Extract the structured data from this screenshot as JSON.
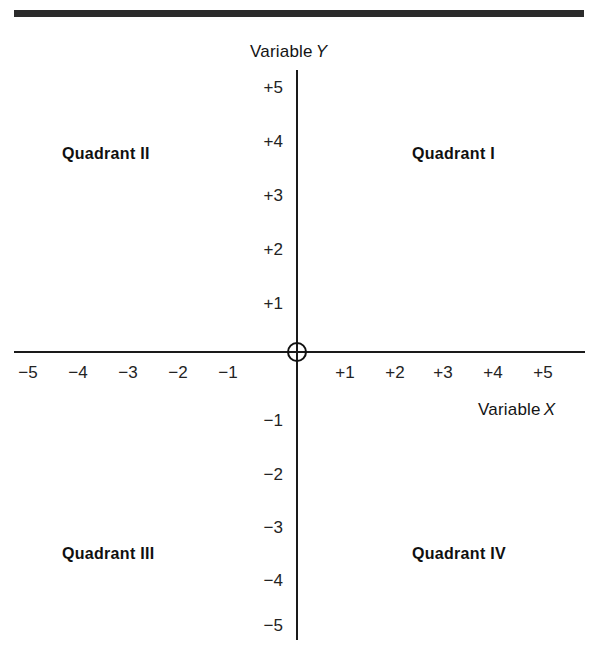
{
  "figure": {
    "top_rule_color": "#2b2b2b",
    "axis_color": "#1a1a1a",
    "background_color": "#ffffff"
  },
  "axis_names": {
    "y_prefix": "Variable",
    "y_letter": "Y",
    "x_prefix": "Variable",
    "x_letter": "X"
  },
  "origin": {
    "marker": "origin-circle",
    "value": "0"
  },
  "quadrants": [
    {
      "key": "q2",
      "label": "Quadrant II",
      "x": 62,
      "y": 145
    },
    {
      "key": "q1",
      "label": "Quadrant I",
      "x": 412,
      "y": 145
    },
    {
      "key": "q3",
      "label": "Quadrant III",
      "x": 62,
      "y": 545
    },
    {
      "key": "q4",
      "label": "Quadrant IV",
      "x": 412,
      "y": 545
    }
  ],
  "y_ticks": [
    {
      "label": "+5",
      "value": 5,
      "top": 78
    },
    {
      "label": "+4",
      "value": 4,
      "top": 132
    },
    {
      "label": "+3",
      "value": 3,
      "top": 186
    },
    {
      "label": "+2",
      "value": 2,
      "top": 240
    },
    {
      "label": "+1",
      "value": 1,
      "top": 294
    },
    {
      "label": "−1",
      "value": -1,
      "top": 411
    },
    {
      "label": "−2",
      "value": -2,
      "top": 465
    },
    {
      "label": "−3",
      "value": -3,
      "top": 518
    },
    {
      "label": "−4",
      "value": -4,
      "top": 571
    },
    {
      "label": "−5",
      "value": -5,
      "top": 616
    }
  ],
  "x_ticks": [
    {
      "label": "−5",
      "value": -5,
      "left": 6
    },
    {
      "label": "−4",
      "value": -4,
      "left": 56
    },
    {
      "label": "−3",
      "value": -3,
      "left": 106
    },
    {
      "label": "−2",
      "value": -2,
      "left": 156
    },
    {
      "label": "−1",
      "value": -1,
      "left": 206
    },
    {
      "label": "+1",
      "value": 1,
      "left": 323
    },
    {
      "label": "+2",
      "value": 2,
      "left": 373
    },
    {
      "label": "+3",
      "value": 3,
      "left": 421
    },
    {
      "label": "+4",
      "value": 4,
      "left": 471
    },
    {
      "label": "+5",
      "value": 5,
      "left": 521
    }
  ],
  "chart_data": {
    "type": "scatter",
    "title": "",
    "subtitle": "",
    "xlabel": "Variable X",
    "ylabel": "Variable Y",
    "xlim": [
      -5.7,
      5.7
    ],
    "ylim": [
      -5.6,
      5.4
    ],
    "xticks": [
      -5,
      -4,
      -3,
      -2,
      -1,
      1,
      2,
      3,
      4,
      5
    ],
    "xticklabels": [
      "−5",
      "−4",
      "−3",
      "−2",
      "−1",
      "+1",
      "+2",
      "+3",
      "+4",
      "+5"
    ],
    "yticks": [
      5,
      4,
      3,
      2,
      1,
      -1,
      -2,
      -3,
      -4,
      -5
    ],
    "yticklabels": [
      "+5",
      "+4",
      "+3",
      "+2",
      "+1",
      "−1",
      "−2",
      "−3",
      "−4",
      "−5"
    ],
    "grid": false,
    "legend": null,
    "series": [],
    "annotations": [
      {
        "text": "Quadrant II",
        "x": -3.3,
        "y": 3.8
      },
      {
        "text": "Quadrant I",
        "x": 2.6,
        "y": 3.8
      },
      {
        "text": "Quadrant III",
        "x": -3.2,
        "y": -3.7
      },
      {
        "text": "Quadrant IV",
        "x": 2.6,
        "y": -3.7
      },
      {
        "text": "origin",
        "x": 0,
        "y": 0
      }
    ]
  }
}
